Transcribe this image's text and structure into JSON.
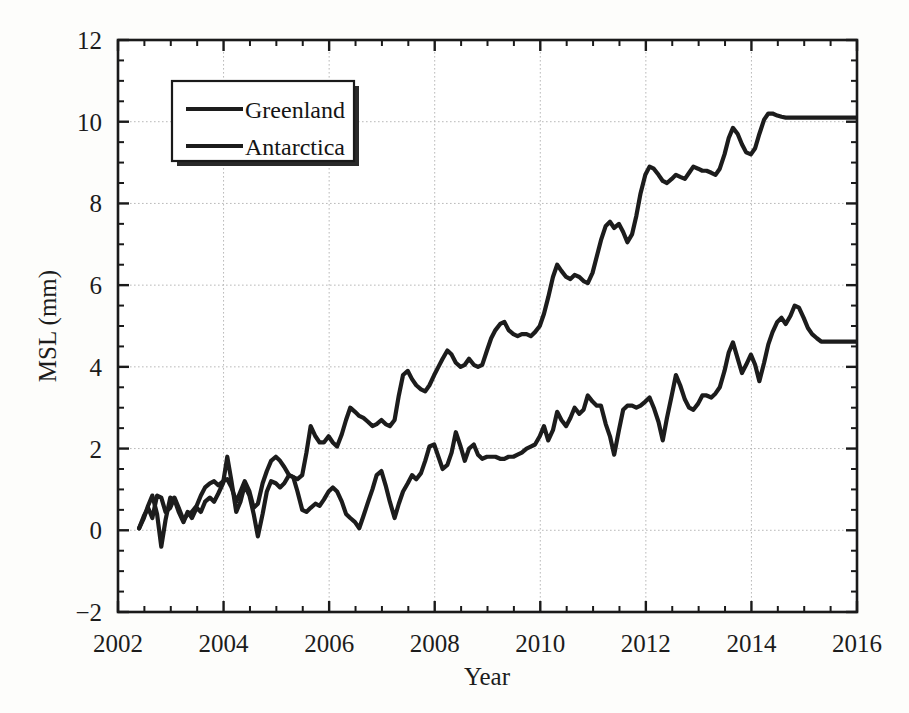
{
  "figure": {
    "background_color": "#fdfdfb",
    "ink_color": "#1c1c1c",
    "grid_color": "#b9b9b9"
  },
  "chart_data": {
    "type": "line",
    "title": "",
    "xlabel": "Year",
    "ylabel": "MSL (mm)",
    "xlim": [
      2002,
      2016
    ],
    "ylim": [
      -2,
      12
    ],
    "xticks": [
      2002,
      2004,
      2006,
      2008,
      2010,
      2012,
      2014,
      2016
    ],
    "xtick_labels": [
      "2002",
      "2004",
      "2006",
      "2008",
      "2010",
      "2012",
      "2014",
      "2016"
    ],
    "yticks": [
      -2,
      0,
      2,
      4,
      6,
      8,
      10,
      12
    ],
    "ytick_labels": [
      "-2",
      "0",
      "2",
      "4",
      "6",
      "8",
      "10",
      "12"
    ],
    "x_minor_step": 0.5,
    "y_minor_step": 0.5,
    "grid": true,
    "grid_style": "dotted",
    "legend_position": "upper-left",
    "series": [
      {
        "name": "Greenland",
        "color": "#1c1c1c",
        "x": [
          2002.4,
          2002.49,
          2002.57,
          2002.65,
          2002.74,
          2002.82,
          2002.9,
          2002.99,
          2003.07,
          2003.15,
          2003.24,
          2003.32,
          2003.4,
          2003.49,
          2003.57,
          2003.65,
          2003.74,
          2003.82,
          2003.9,
          2003.99,
          2004.07,
          2004.15,
          2004.24,
          2004.32,
          2004.4,
          2004.49,
          2004.57,
          2004.65,
          2004.74,
          2004.82,
          2004.9,
          2004.99,
          2005.07,
          2005.15,
          2005.24,
          2005.32,
          2005.4,
          2005.49,
          2005.57,
          2005.65,
          2005.74,
          2005.82,
          2005.9,
          2005.99,
          2006.07,
          2006.15,
          2006.24,
          2006.32,
          2006.4,
          2006.49,
          2006.57,
          2006.65,
          2006.74,
          2006.82,
          2006.9,
          2006.99,
          2007.07,
          2007.15,
          2007.24,
          2007.32,
          2007.4,
          2007.49,
          2007.57,
          2007.65,
          2007.74,
          2007.82,
          2007.9,
          2007.99,
          2008.07,
          2008.15,
          2008.24,
          2008.32,
          2008.4,
          2008.49,
          2008.57,
          2008.65,
          2008.74,
          2008.82,
          2008.9,
          2008.99,
          2009.07,
          2009.15,
          2009.24,
          2009.32,
          2009.4,
          2009.49,
          2009.57,
          2009.65,
          2009.74,
          2009.82,
          2009.9,
          2009.99,
          2010.07,
          2010.15,
          2010.24,
          2010.32,
          2010.4,
          2010.49,
          2010.57,
          2010.65,
          2010.74,
          2010.82,
          2010.9,
          2010.99,
          2011.07,
          2011.15,
          2011.24,
          2011.32,
          2011.4,
          2011.49,
          2011.57,
          2011.65,
          2011.74,
          2011.82,
          2011.9,
          2011.99,
          2012.07,
          2012.15,
          2012.24,
          2012.32,
          2012.4,
          2012.49,
          2012.57,
          2012.65,
          2012.74,
          2012.82,
          2012.9,
          2012.99,
          2013.07,
          2013.15,
          2013.24,
          2013.32,
          2013.4,
          2013.49,
          2013.57,
          2013.65,
          2013.74,
          2013.82,
          2013.9,
          2013.99,
          2014.07,
          2014.15,
          2014.24,
          2014.32,
          2014.4,
          2014.49,
          2014.57,
          2014.65,
          2014.74,
          2014.82,
          2014.9,
          2014.99,
          2015.07,
          2015.15,
          2015.24,
          2015.32,
          2015.4,
          2015.49,
          2015.57,
          2015.65,
          2015.74,
          2015.82,
          2015.9,
          2015.99
        ],
        "y": [
          0.05,
          0.35,
          0.55,
          0.3,
          0.85,
          0.8,
          0.45,
          0.55,
          0.8,
          0.55,
          0.25,
          0.4,
          0.45,
          0.6,
          0.85,
          1.05,
          1.15,
          1.2,
          1.1,
          1.2,
          1.25,
          1.05,
          0.7,
          0.95,
          1.2,
          0.95,
          0.55,
          0.65,
          1.15,
          1.45,
          1.7,
          1.8,
          1.7,
          1.55,
          1.35,
          1.3,
          1.25,
          1.35,
          1.9,
          2.55,
          2.3,
          2.15,
          2.15,
          2.3,
          2.15,
          2.05,
          2.35,
          2.7,
          3.0,
          2.9,
          2.8,
          2.75,
          2.65,
          2.55,
          2.6,
          2.7,
          2.6,
          2.55,
          2.7,
          3.3,
          3.8,
          3.9,
          3.7,
          3.55,
          3.45,
          3.4,
          3.55,
          3.8,
          4.0,
          4.2,
          4.4,
          4.3,
          4.1,
          4.0,
          4.05,
          4.2,
          4.05,
          4.0,
          4.05,
          4.4,
          4.7,
          4.9,
          5.05,
          5.1,
          4.9,
          4.8,
          4.75,
          4.8,
          4.8,
          4.75,
          4.85,
          5.0,
          5.3,
          5.7,
          6.2,
          6.5,
          6.35,
          6.2,
          6.15,
          6.25,
          6.2,
          6.1,
          6.05,
          6.3,
          6.7,
          7.1,
          7.45,
          7.55,
          7.4,
          7.5,
          7.3,
          7.05,
          7.25,
          7.7,
          8.25,
          8.7,
          8.9,
          8.85,
          8.7,
          8.55,
          8.5,
          8.6,
          8.7,
          8.65,
          8.6,
          8.75,
          8.9,
          8.85,
          8.8,
          8.8,
          8.75,
          8.7,
          8.85,
          9.2,
          9.6,
          9.85,
          9.7,
          9.45,
          9.25,
          9.2,
          9.35,
          9.7,
          10.05,
          10.2,
          10.2,
          10.15,
          10.12,
          10.1,
          10.1,
          10.1,
          10.1,
          10.1,
          10.1,
          10.1,
          10.1,
          10.1,
          10.1,
          10.1,
          10.1,
          10.1,
          10.1,
          10.1,
          10.1,
          10.1
        ]
      },
      {
        "name": "Antarctica",
        "color": "#1c1c1c",
        "x": [
          2002.4,
          2002.49,
          2002.57,
          2002.65,
          2002.74,
          2002.82,
          2002.9,
          2002.99,
          2003.07,
          2003.15,
          2003.24,
          2003.32,
          2003.4,
          2003.49,
          2003.57,
          2003.65,
          2003.74,
          2003.82,
          2003.9,
          2003.99,
          2004.07,
          2004.15,
          2004.24,
          2004.32,
          2004.4,
          2004.49,
          2004.57,
          2004.65,
          2004.74,
          2004.82,
          2004.9,
          2004.99,
          2005.07,
          2005.15,
          2005.24,
          2005.32,
          2005.4,
          2005.49,
          2005.57,
          2005.65,
          2005.74,
          2005.82,
          2005.9,
          2005.99,
          2006.07,
          2006.15,
          2006.24,
          2006.32,
          2006.4,
          2006.49,
          2006.57,
          2006.65,
          2006.74,
          2006.82,
          2006.9,
          2006.99,
          2007.07,
          2007.15,
          2007.24,
          2007.32,
          2007.4,
          2007.49,
          2007.57,
          2007.65,
          2007.74,
          2007.82,
          2007.9,
          2007.99,
          2008.07,
          2008.15,
          2008.24,
          2008.32,
          2008.4,
          2008.49,
          2008.57,
          2008.65,
          2008.74,
          2008.82,
          2008.9,
          2008.99,
          2009.07,
          2009.15,
          2009.24,
          2009.32,
          2009.4,
          2009.49,
          2009.57,
          2009.65,
          2009.74,
          2009.82,
          2009.9,
          2009.99,
          2010.07,
          2010.15,
          2010.24,
          2010.32,
          2010.4,
          2010.49,
          2010.57,
          2010.65,
          2010.74,
          2010.82,
          2010.9,
          2010.99,
          2011.07,
          2011.15,
          2011.24,
          2011.32,
          2011.4,
          2011.49,
          2011.57,
          2011.65,
          2011.74,
          2011.82,
          2011.9,
          2011.99,
          2012.07,
          2012.15,
          2012.24,
          2012.32,
          2012.4,
          2012.49,
          2012.57,
          2012.65,
          2012.74,
          2012.82,
          2012.9,
          2012.99,
          2013.07,
          2013.15,
          2013.24,
          2013.32,
          2013.4,
          2013.49,
          2013.57,
          2013.65,
          2013.74,
          2013.82,
          2013.9,
          2013.99,
          2014.07,
          2014.15,
          2014.24,
          2014.32,
          2014.4,
          2014.49,
          2014.57,
          2014.65,
          2014.74,
          2014.82,
          2014.9,
          2014.99,
          2015.07,
          2015.15,
          2015.24,
          2015.32,
          2015.4,
          2015.49,
          2015.57,
          2015.65,
          2015.74,
          2015.82,
          2015.9,
          2015.99
        ],
        "y": [
          0.05,
          0.3,
          0.6,
          0.85,
          0.4,
          -0.4,
          0.25,
          0.8,
          0.75,
          0.45,
          0.2,
          0.45,
          0.3,
          0.55,
          0.45,
          0.7,
          0.8,
          0.7,
          0.9,
          1.15,
          1.8,
          1.2,
          0.45,
          0.7,
          1.1,
          0.85,
          0.4,
          -0.15,
          0.4,
          0.95,
          1.2,
          1.15,
          1.05,
          1.15,
          1.35,
          1.3,
          0.95,
          0.5,
          0.45,
          0.55,
          0.65,
          0.6,
          0.75,
          0.95,
          1.05,
          0.95,
          0.7,
          0.4,
          0.3,
          0.2,
          0.05,
          0.35,
          0.7,
          1.0,
          1.35,
          1.45,
          1.1,
          0.7,
          0.3,
          0.65,
          0.95,
          1.15,
          1.35,
          1.25,
          1.4,
          1.7,
          2.05,
          2.1,
          1.8,
          1.5,
          1.6,
          1.9,
          2.4,
          2.05,
          1.7,
          2.0,
          2.1,
          1.85,
          1.75,
          1.8,
          1.8,
          1.8,
          1.75,
          1.75,
          1.8,
          1.8,
          1.85,
          1.9,
          2.0,
          2.05,
          2.1,
          2.3,
          2.55,
          2.2,
          2.45,
          2.9,
          2.7,
          2.55,
          2.75,
          3.0,
          2.85,
          2.95,
          3.3,
          3.15,
          3.05,
          3.05,
          2.6,
          2.3,
          1.85,
          2.45,
          2.95,
          3.05,
          3.05,
          3.0,
          3.05,
          3.15,
          3.25,
          3.0,
          2.65,
          2.2,
          2.75,
          3.3,
          3.8,
          3.55,
          3.2,
          3.0,
          2.95,
          3.1,
          3.3,
          3.3,
          3.25,
          3.35,
          3.5,
          3.9,
          4.35,
          4.6,
          4.2,
          3.85,
          4.05,
          4.3,
          4.05,
          3.65,
          4.1,
          4.55,
          4.85,
          5.1,
          5.2,
          5.05,
          5.25,
          5.5,
          5.45,
          5.2,
          4.95,
          4.8,
          4.7,
          4.62,
          4.62,
          4.62,
          4.62,
          4.62,
          4.62,
          4.62,
          4.62,
          4.62
        ]
      }
    ],
    "legend": [
      {
        "label": "Greenland"
      },
      {
        "label": "Antarctica"
      }
    ]
  }
}
